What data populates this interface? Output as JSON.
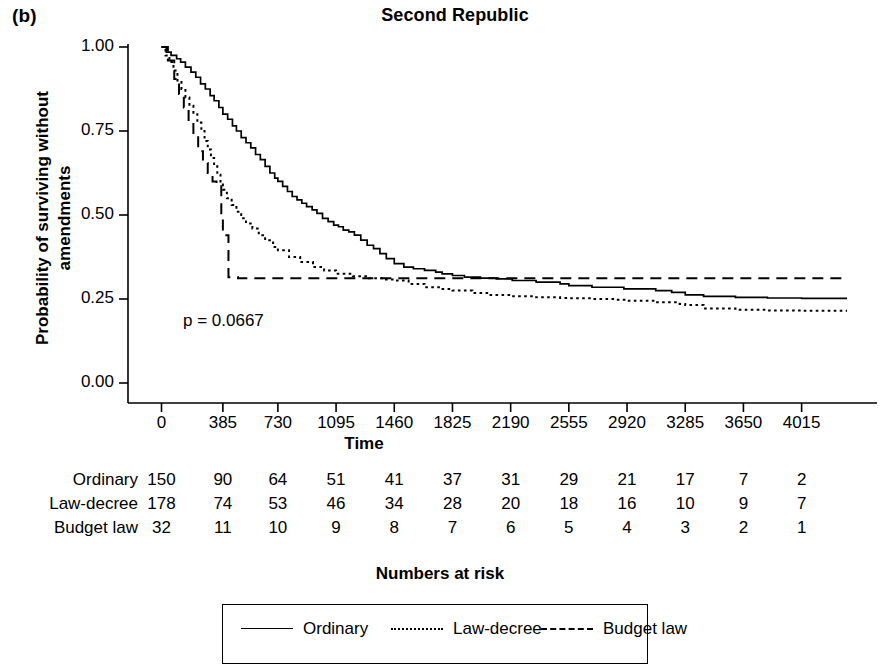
{
  "figure": {
    "panel_label": "(b)",
    "title": "Second Republic",
    "ylabel_line1": "Probability of surviving without",
    "ylabel_line2": "amendments",
    "xlabel": "Time",
    "risk_caption": "Numbers at risk",
    "pvalue_text": "p = 0.0667",
    "axis_color": "#000000"
  },
  "chart_data": {
    "type": "line",
    "title": "Second Republic",
    "subtitle": "(b)",
    "xlabel": "Time",
    "ylabel": "Probability of surviving without amendments",
    "annotation": "p = 0.0667",
    "grid": false,
    "legend_position": "bottom",
    "xlim": [
      0,
      4400
    ],
    "ylim": [
      0.0,
      1.0
    ],
    "xticks": [
      0,
      385,
      730,
      1095,
      1460,
      1825,
      2190,
      2555,
      2920,
      3285,
      3650,
      4015
    ],
    "xtick_labels": [
      "0",
      "385",
      "730",
      "1095",
      "1460",
      "1825",
      "2190",
      "2555",
      "2920",
      "3285",
      "3650",
      "4015"
    ],
    "yticks": [
      0.0,
      0.25,
      0.5,
      0.75,
      1.0
    ],
    "ytick_labels": [
      "0.00",
      "0.25",
      "0.50",
      "0.75",
      "1.00"
    ],
    "series": [
      {
        "name": "Ordinary",
        "style": "solid",
        "x": [
          0,
          30,
          60,
          95,
          120,
          150,
          185,
          215,
          245,
          275,
          305,
          330,
          360,
          385,
          415,
          445,
          470,
          500,
          530,
          560,
          590,
          620,
          650,
          680,
          710,
          730,
          760,
          790,
          820,
          850,
          880,
          910,
          945,
          975,
          1010,
          1045,
          1080,
          1110,
          1140,
          1175,
          1210,
          1250,
          1290,
          1330,
          1370,
          1410,
          1460,
          1520,
          1580,
          1650,
          1720,
          1760,
          1825,
          1900,
          2000,
          2100,
          2200,
          2350,
          2500,
          2555,
          2700,
          2900,
          3100,
          3200,
          3285,
          3400,
          3600,
          3800,
          4015,
          4300
        ],
        "y": [
          1.0,
          0.985,
          0.975,
          0.965,
          0.955,
          0.94,
          0.925,
          0.91,
          0.89,
          0.875,
          0.855,
          0.84,
          0.82,
          0.8,
          0.785,
          0.765,
          0.75,
          0.73,
          0.715,
          0.7,
          0.68,
          0.665,
          0.645,
          0.625,
          0.61,
          0.6,
          0.585,
          0.57,
          0.555,
          0.545,
          0.535,
          0.525,
          0.515,
          0.505,
          0.49,
          0.48,
          0.47,
          0.465,
          0.455,
          0.45,
          0.44,
          0.425,
          0.41,
          0.4,
          0.385,
          0.37,
          0.355,
          0.345,
          0.34,
          0.335,
          0.33,
          0.325,
          0.32,
          0.315,
          0.312,
          0.31,
          0.305,
          0.3,
          0.295,
          0.29,
          0.285,
          0.28,
          0.275,
          0.27,
          0.262,
          0.258,
          0.255,
          0.253,
          0.252,
          0.252
        ]
      },
      {
        "name": "Law-decree",
        "style": "dotted",
        "x": [
          0,
          25,
          50,
          75,
          100,
          125,
          150,
          175,
          200,
          225,
          250,
          270,
          290,
          310,
          330,
          350,
          370,
          385,
          410,
          440,
          470,
          500,
          530,
          570,
          610,
          650,
          700,
          730,
          800,
          870,
          950,
          1020,
          1095,
          1200,
          1300,
          1400,
          1460,
          1550,
          1650,
          1750,
          1825,
          1950,
          2050,
          2190,
          2350,
          2500,
          2555,
          2700,
          2850,
          2920,
          3100,
          3250,
          3285,
          3400,
          3600,
          3800,
          4015,
          4300
        ],
        "y": [
          1.0,
          0.975,
          0.955,
          0.93,
          0.9,
          0.875,
          0.85,
          0.825,
          0.8,
          0.775,
          0.75,
          0.72,
          0.695,
          0.67,
          0.645,
          0.62,
          0.595,
          0.575,
          0.55,
          0.53,
          0.51,
          0.49,
          0.475,
          0.46,
          0.44,
          0.425,
          0.405,
          0.395,
          0.375,
          0.36,
          0.345,
          0.335,
          0.325,
          0.318,
          0.312,
          0.308,
          0.305,
          0.295,
          0.285,
          0.28,
          0.275,
          0.268,
          0.262,
          0.258,
          0.255,
          0.253,
          0.252,
          0.25,
          0.248,
          0.245,
          0.24,
          0.235,
          0.232,
          0.222,
          0.218,
          0.216,
          0.215,
          0.215
        ]
      },
      {
        "name": "Budget law",
        "style": "dashed",
        "x": [
          0,
          40,
          80,
          110,
          140,
          170,
          200,
          230,
          260,
          290,
          320,
          345,
          360,
          375,
          385,
          420,
          480,
          560,
          650,
          730,
          900,
          1095,
          1300,
          1460,
          1825,
          2190,
          2555,
          2920,
          3285,
          3650,
          4015,
          4300
        ],
        "y": [
          1.0,
          0.96,
          0.905,
          0.86,
          0.82,
          0.78,
          0.735,
          0.69,
          0.655,
          0.625,
          0.6,
          0.595,
          0.59,
          0.5,
          0.44,
          0.315,
          0.312,
          0.312,
          0.312,
          0.312,
          0.312,
          0.312,
          0.312,
          0.312,
          0.312,
          0.312,
          0.312,
          0.312,
          0.312,
          0.312,
          0.312,
          0.312
        ]
      }
    ]
  },
  "risk_table": {
    "columns": [
      "0",
      "385",
      "730",
      "1095",
      "1460",
      "1825",
      "2190",
      "2555",
      "2920",
      "3285",
      "3650",
      "4015"
    ],
    "rows": [
      {
        "label": "Ordinary",
        "values": [
          "150",
          "90",
          "64",
          "51",
          "41",
          "37",
          "31",
          "29",
          "21",
          "17",
          "7",
          "2"
        ]
      },
      {
        "label": "Law-decree",
        "values": [
          "178",
          "74",
          "53",
          "46",
          "34",
          "28",
          "20",
          "18",
          "16",
          "10",
          "9",
          "7"
        ]
      },
      {
        "label": "Budget law",
        "values": [
          "32",
          "11",
          "10",
          "9",
          "8",
          "7",
          "6",
          "5",
          "4",
          "3",
          "2",
          "1"
        ]
      }
    ]
  },
  "legend": {
    "items": [
      {
        "label": "Ordinary",
        "style": "solid"
      },
      {
        "label": "Law-decree",
        "style": "dotted"
      },
      {
        "label": "Budget law",
        "style": "dashed"
      }
    ]
  }
}
